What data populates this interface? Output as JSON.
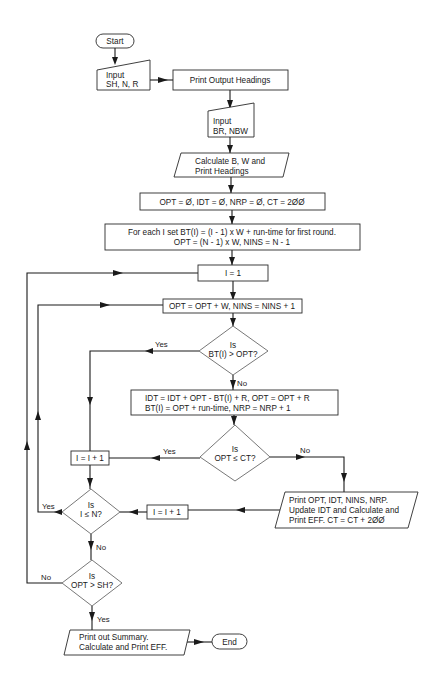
{
  "flowchart": {
    "start": "Start",
    "input1": [
      "Input",
      "SH, N, R"
    ],
    "print_headings": "Print Output Headings",
    "input2": [
      "Input",
      "BR, NBW"
    ],
    "calculate": [
      "Calculate B, W and",
      "Print Headings"
    ],
    "init": "OPT = Ø, IDT = Ø, NRP = Ø, CT = 2ØØ",
    "for_each": [
      "For each I set BT(I) = (I - 1) x W + run-time for first round.",
      "OPT = (N - 1) x W, NINS = N - 1"
    ],
    "set_i": "I = 1",
    "opt_update": "OPT = OPT + W, NINS = NINS + 1",
    "decision_bt": [
      "Is",
      "BT(I) > OPT?"
    ],
    "idt_update": [
      "IDT = IDT + OPT - BT(I) + R, OPT = OPT + R",
      "BT(I) = OPT + run-time, NRP = NRP + 1"
    ],
    "decision_ct": [
      "Is",
      "OPT ≤ CT?"
    ],
    "incr_upper": "I = I + 1",
    "print_stats": [
      "Print OPT, IDT, NINS, NRP.",
      "Update IDT and Calculate and",
      "Print EFF.  CT = CT + 2ØØ"
    ],
    "incr_middle": "I = I + 1",
    "decision_n": [
      "Is",
      "I ≤ N?"
    ],
    "decision_sh": [
      "Is",
      "OPT > SH?"
    ],
    "summary": [
      "Print out Summary.",
      "Calculate and Print EFF."
    ],
    "end": "End",
    "labels": {
      "yes": "Yes",
      "no": "No"
    }
  },
  "colors": {
    "line": "#1a1a1a",
    "background": "#ffffff"
  }
}
